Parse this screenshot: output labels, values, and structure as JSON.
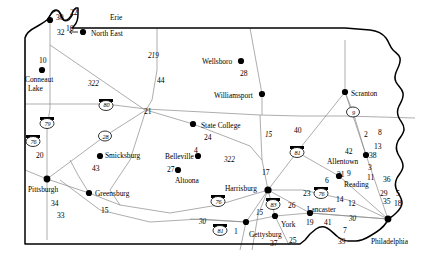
{
  "map": {
    "title": "Pennsylvania sampling site map",
    "state_outline_color": "#000000",
    "road_color": "#8a8a8a",
    "marker_color": "#000000",
    "background": "#ffffff"
  },
  "cities": [
    {
      "name": "Erie",
      "x": 110,
      "y": 14,
      "dot_x": 50,
      "dot_y": 20,
      "anchor": "right"
    },
    {
      "name": "North East",
      "x": 91,
      "y": 30,
      "dot_x": 83,
      "dot_y": 32,
      "anchor": "left"
    },
    {
      "name": "Conneaut",
      "x": 25,
      "y": 76,
      "dot_x": 42,
      "dot_y": 70,
      "anchor": "left"
    },
    {
      "name": "Lake",
      "x": 28,
      "y": 85,
      "dot_x": null,
      "dot_y": null,
      "anchor": "left"
    },
    {
      "name": "Wellsboro",
      "x": 202,
      "y": 58,
      "dot_x": 241,
      "dot_y": 61,
      "anchor": "left"
    },
    {
      "name": "Williamsport",
      "x": 214,
      "y": 92,
      "dot_x": 262,
      "dot_y": 94,
      "anchor": "left"
    },
    {
      "name": "Scranton",
      "x": 351,
      "y": 90,
      "dot_x": 345,
      "dot_y": 92,
      "anchor": "left"
    },
    {
      "name": "State College",
      "x": 201,
      "y": 122,
      "dot_x": 193,
      "dot_y": 124,
      "anchor": "left"
    },
    {
      "name": "Smicksburg",
      "x": 105,
      "y": 152,
      "dot_x": 100,
      "dot_y": 156,
      "anchor": "left"
    },
    {
      "name": "Belleville",
      "x": 165,
      "y": 153,
      "dot_x": 198,
      "dot_y": 156,
      "anchor": "left"
    },
    {
      "name": "Altoona",
      "x": 175,
      "y": 177,
      "dot_x": 178,
      "dot_y": 170,
      "anchor": "left"
    },
    {
      "name": "Allentown",
      "x": 327,
      "y": 158,
      "dot_x": 366,
      "dot_y": 155,
      "anchor": "left"
    },
    {
      "name": "Reading",
      "x": 344,
      "y": 181,
      "dot_x": 339,
      "dot_y": 176,
      "anchor": "left"
    },
    {
      "name": "Pittsburgh",
      "x": 28,
      "y": 186,
      "dot_x": 47,
      "dot_y": 179,
      "anchor": "left"
    },
    {
      "name": "Greensburg",
      "x": 95,
      "y": 190,
      "dot_x": 89,
      "dot_y": 193,
      "anchor": "left"
    },
    {
      "name": "Harrisburg",
      "x": 225,
      "y": 185,
      "dot_x": 268,
      "dot_y": 190,
      "anchor": "left"
    },
    {
      "name": "Lancaster",
      "x": 307,
      "y": 206,
      "dot_x": 310,
      "dot_y": 213,
      "anchor": "left"
    },
    {
      "name": "York",
      "x": 281,
      "y": 221,
      "dot_x": 275,
      "dot_y": 216,
      "anchor": "left"
    },
    {
      "name": "Gettysburg",
      "x": 249,
      "y": 231,
      "dot_x": 246,
      "dot_y": 222,
      "anchor": "left"
    },
    {
      "name": "Philadelphia",
      "x": 371,
      "y": 238,
      "dot_x": 388,
      "dot_y": 219,
      "anchor": "left"
    }
  ],
  "site_numbers": [
    {
      "n": "22",
      "x": 70,
      "y": 9
    },
    {
      "n": "30",
      "x": 56,
      "y": 14
    },
    {
      "n": "16",
      "x": 66,
      "y": 25
    },
    {
      "n": "32",
      "x": 57,
      "y": 29
    },
    {
      "n": "10",
      "x": 39,
      "y": 57
    },
    {
      "n": "44",
      "x": 157,
      "y": 77
    },
    {
      "n": "28",
      "x": 240,
      "y": 70
    },
    {
      "n": "24",
      "x": 204,
      "y": 134
    },
    {
      "n": "40",
      "x": 294,
      "y": 127
    },
    {
      "n": "2",
      "x": 364,
      "y": 131
    },
    {
      "n": "8",
      "x": 378,
      "y": 129
    },
    {
      "n": "13",
      "x": 374,
      "y": 143
    },
    {
      "n": "42",
      "x": 345,
      "y": 148
    },
    {
      "n": "38",
      "x": 369,
      "y": 152
    },
    {
      "n": "20",
      "x": 36,
      "y": 152
    },
    {
      "n": "43",
      "x": 92,
      "y": 165
    },
    {
      "n": "4",
      "x": 194,
      "y": 147
    },
    {
      "n": "27",
      "x": 167,
      "y": 166
    },
    {
      "n": "17",
      "x": 262,
      "y": 169
    },
    {
      "n": "3",
      "x": 368,
      "y": 164
    },
    {
      "n": "31",
      "x": 337,
      "y": 171
    },
    {
      "n": "9",
      "x": 347,
      "y": 170
    },
    {
      "n": "6",
      "x": 325,
      "y": 177
    },
    {
      "n": "11",
      "x": 367,
      "y": 174
    },
    {
      "n": "36",
      "x": 383,
      "y": 176
    },
    {
      "n": "29",
      "x": 380,
      "y": 190
    },
    {
      "n": "5",
      "x": 396,
      "y": 190
    },
    {
      "n": "35",
      "x": 383,
      "y": 198
    },
    {
      "n": "18",
      "x": 394,
      "y": 200
    },
    {
      "n": "34",
      "x": 51,
      "y": 200
    },
    {
      "n": "33",
      "x": 57,
      "y": 212
    },
    {
      "n": "15",
      "x": 101,
      "y": 207
    },
    {
      "n": "23",
      "x": 303,
      "y": 190
    },
    {
      "n": "14",
      "x": 336,
      "y": 196
    },
    {
      "n": "12",
      "x": 348,
      "y": 200
    },
    {
      "n": "26",
      "x": 288,
      "y": 202
    },
    {
      "n": "19",
      "x": 306,
      "y": 219
    },
    {
      "n": "41",
      "x": 324,
      "y": 219
    },
    {
      "n": "1",
      "x": 234,
      "y": 228
    },
    {
      "n": "37",
      "x": 270,
      "y": 240
    },
    {
      "n": "25",
      "x": 289,
      "y": 237
    },
    {
      "n": "7",
      "x": 343,
      "y": 227
    },
    {
      "n": "39",
      "x": 338,
      "y": 238
    },
    {
      "n": "21",
      "x": 144,
      "y": 108
    }
  ],
  "route_numbers": [
    {
      "n": "219",
      "x": 148,
      "y": 53
    },
    {
      "n": "322",
      "x": 88,
      "y": 81
    },
    {
      "n": "322",
      "x": 224,
      "y": 157
    },
    {
      "n": "15",
      "x": 265,
      "y": 132
    },
    {
      "n": "15",
      "x": 256,
      "y": 210
    },
    {
      "n": "30",
      "x": 199,
      "y": 219
    },
    {
      "n": "30",
      "x": 349,
      "y": 216
    }
  ],
  "shields": [
    {
      "label": "80",
      "x": 106,
      "y": 104,
      "type": "interstate"
    },
    {
      "label": "79",
      "x": 47,
      "y": 123,
      "type": "interstate"
    },
    {
      "label": "76",
      "x": 33,
      "y": 141,
      "type": "turnpike"
    },
    {
      "label": "28",
      "x": 105,
      "y": 136,
      "type": "circle"
    },
    {
      "label": "9",
      "x": 353,
      "y": 112,
      "type": "circle"
    },
    {
      "label": "81",
      "x": 297,
      "y": 152,
      "type": "interstate"
    },
    {
      "label": "76",
      "x": 321,
      "y": 193,
      "type": "turnpike"
    },
    {
      "label": "76",
      "x": 218,
      "y": 201,
      "type": "interstate"
    },
    {
      "label": "83",
      "x": 273,
      "y": 204,
      "type": "interstate"
    },
    {
      "label": "81",
      "x": 220,
      "y": 230,
      "type": "interstate"
    }
  ]
}
